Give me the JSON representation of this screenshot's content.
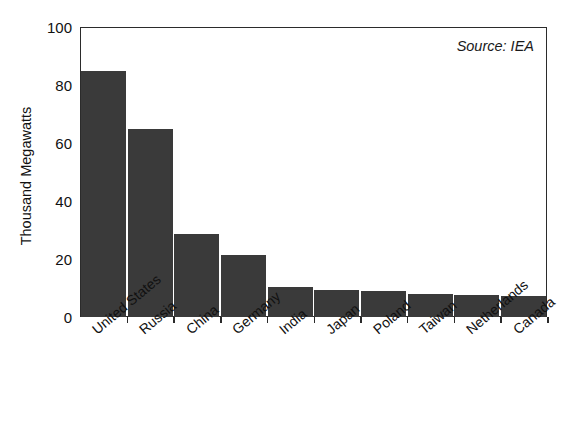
{
  "chart_data": {
    "type": "bar",
    "title": "",
    "subtitle": "",
    "xlabel": "",
    "ylabel": "Thousand Megawatts",
    "ylim": [
      0,
      100
    ],
    "yticks": [
      0,
      20,
      40,
      60,
      80,
      100
    ],
    "ytick_labels": [
      "0",
      "20",
      "40",
      "60",
      "80",
      "100"
    ],
    "grid": false,
    "legend": null,
    "orientation": "vertical",
    "bar_color": "#3a3a3a",
    "frame_color": "#2b2b2b",
    "annotations": [
      {
        "name": "source",
        "text": "Source: IEA",
        "position": "top-right",
        "style": "italic"
      }
    ],
    "categories": [
      "United States",
      "Russia",
      "China",
      "Germany",
      "India",
      "Japan",
      "Poland",
      "Taiwan",
      "Netherlands",
      "Canada"
    ],
    "values": [
      85,
      65,
      28.5,
      21.5,
      10.3,
      9.2,
      8.8,
      8.0,
      7.6,
      7.2
    ],
    "value_labels": [
      "85",
      "65",
      "28.5",
      "21.5",
      "10.3",
      "9.2",
      "8.8",
      "8.0",
      "7.6",
      "7.2"
    ]
  },
  "figure": {
    "title_cut_off": "",
    "source_note": "Source: IEA",
    "y_axis_title": "Thousand Megawatts"
  }
}
